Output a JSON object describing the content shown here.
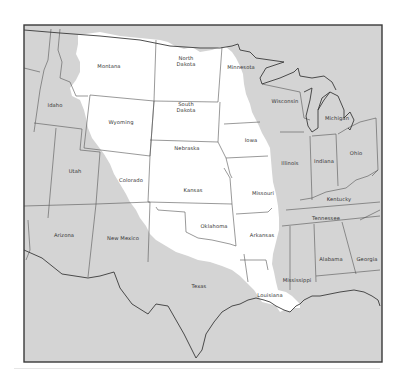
{
  "map": {
    "title": "",
    "colors": {
      "background": "#ffffff",
      "land_outside": "#d4d4d4",
      "basin_highlight": "#ffffff",
      "state_border": "#555555",
      "frame": "#3a3a3a",
      "coast": "#3a3a3a"
    },
    "highlighted_region": "Mississippi River drainage basin (western portion)",
    "states": [
      {
        "name": "Montana",
        "x": 109,
        "y": 66,
        "highlighted": true
      },
      {
        "name": "North Dakota",
        "x": 186,
        "y": 61,
        "highlighted": true,
        "multiline": [
          "North",
          "Dakota"
        ]
      },
      {
        "name": "Minnesota",
        "x": 241,
        "y": 67,
        "highlighted": true
      },
      {
        "name": "Wisconsin",
        "x": 285,
        "y": 101,
        "highlighted": false
      },
      {
        "name": "Michigan",
        "x": 337,
        "y": 118,
        "highlighted": false
      },
      {
        "name": "Idaho",
        "x": 55,
        "y": 105,
        "highlighted": false
      },
      {
        "name": "South Dakota",
        "x": 186,
        "y": 107,
        "highlighted": true,
        "multiline": [
          "South",
          "Dakota"
        ]
      },
      {
        "name": "Wyoming",
        "x": 121,
        "y": 122,
        "highlighted": true
      },
      {
        "name": "Iowa",
        "x": 251,
        "y": 140,
        "highlighted": true
      },
      {
        "name": "Nebraska",
        "x": 187,
        "y": 148,
        "highlighted": true
      },
      {
        "name": "Illinois",
        "x": 290,
        "y": 163,
        "highlighted": false
      },
      {
        "name": "Indiana",
        "x": 324,
        "y": 161,
        "highlighted": false
      },
      {
        "name": "Ohio",
        "x": 356,
        "y": 153,
        "highlighted": false
      },
      {
        "name": "Utah",
        "x": 75,
        "y": 171,
        "highlighted": false
      },
      {
        "name": "Colorado",
        "x": 131,
        "y": 180,
        "highlighted": true
      },
      {
        "name": "Kansas",
        "x": 193,
        "y": 190,
        "highlighted": true
      },
      {
        "name": "Missouri",
        "x": 263,
        "y": 193,
        "highlighted": true
      },
      {
        "name": "Kentucky",
        "x": 339,
        "y": 199,
        "highlighted": false
      },
      {
        "name": "Tennessee",
        "x": 326,
        "y": 218,
        "highlighted": false
      },
      {
        "name": "Arizona",
        "x": 64,
        "y": 235,
        "highlighted": false
      },
      {
        "name": "New Mexico",
        "x": 123,
        "y": 238,
        "highlighted": false
      },
      {
        "name": "Oklahoma",
        "x": 214,
        "y": 226,
        "highlighted": true
      },
      {
        "name": "Arkansas",
        "x": 262,
        "y": 235,
        "highlighted": true
      },
      {
        "name": "Alabama",
        "x": 331,
        "y": 259,
        "highlighted": false
      },
      {
        "name": "Georgia",
        "x": 367,
        "y": 259,
        "highlighted": false
      },
      {
        "name": "Texas",
        "x": 199,
        "y": 286,
        "highlighted": false
      },
      {
        "name": "Mississippi",
        "x": 297,
        "y": 280,
        "highlighted": false
      },
      {
        "name": "Louisiana",
        "x": 270,
        "y": 295,
        "highlighted": false
      }
    ]
  }
}
